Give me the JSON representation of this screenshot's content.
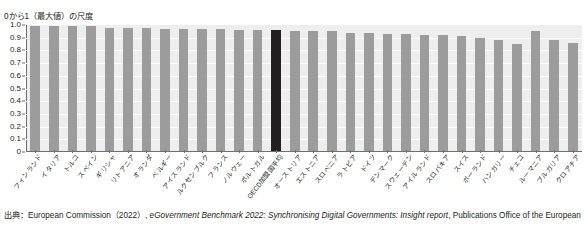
{
  "axis_title": "0から1（最大値）の尺度",
  "source": {
    "prefix": "出典：",
    "org": "European Commission（2022）,",
    "title_italic": "eGovernment Benchmark 2022: Synchronising Digital Governments: Insight report",
    "suffix": ", Publications Office of the European"
  },
  "chart_data": {
    "type": "bar",
    "title": "0から1（最大値）の尺度",
    "xlabel": "",
    "ylabel": "0から1（最大値）の尺度",
    "ylim": [
      0,
      1.0
    ],
    "yticks": [
      "1.0",
      "0.9",
      "0.8",
      "0.7",
      "0.6",
      "0.5",
      "0.4",
      "0.3",
      "0.2",
      "0.1",
      "0"
    ],
    "grid": true,
    "legend": "none",
    "highlight_category": "OECD加盟国平均",
    "colors": {
      "bar": "#9c9c9c",
      "highlight": "#231f20",
      "plot_background": "#eeeeee",
      "gridline": "#ffffff"
    },
    "categories": [
      "フィンランド",
      "イタリア",
      "トルコ",
      "スペイン",
      "ギリシャ",
      "リトアニア",
      "オランダ",
      "ベルギー",
      "アイスランド",
      "ルクセンブルク",
      "フランス",
      "ノルウェー",
      "ポルトガル",
      "OECD加盟国平均",
      "オーストリア",
      "エストニア",
      "スロベニア",
      "ラトビア",
      "ドイツ",
      "デンマーク",
      "スウェーデン",
      "アイルランド",
      "スロバキア",
      "スイス",
      "ポーランド",
      "ハンガリー",
      "チェコ",
      "ルーマニア",
      "ブルガリア",
      "クロアチア"
    ],
    "values": [
      0.99,
      0.99,
      0.99,
      0.99,
      0.98,
      0.98,
      0.98,
      0.97,
      0.97,
      0.97,
      0.97,
      0.96,
      0.96,
      0.96,
      0.95,
      0.95,
      0.95,
      0.94,
      0.94,
      0.93,
      0.93,
      0.92,
      0.92,
      0.91,
      0.9,
      0.88,
      0.85,
      0.95,
      0.88,
      0.86
    ]
  }
}
